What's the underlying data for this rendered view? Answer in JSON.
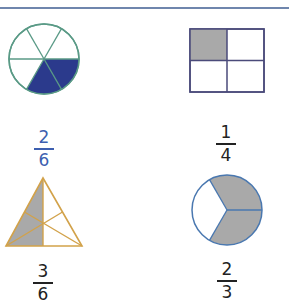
{
  "header": {
    "rule_color": "#6f86ad"
  },
  "figures": [
    {
      "shape": "circle",
      "parts": 6,
      "shaded": 2,
      "stroke_color": "#5a9a86",
      "fill_color": "#2b3a8c",
      "fraction": {
        "numerator": "2",
        "denominator": "6",
        "color": "#3d5fb0"
      }
    },
    {
      "shape": "square",
      "parts": 4,
      "shaded": 1,
      "stroke_color": "#4a4a7a",
      "fill_color": "#a9a9a9",
      "fraction": {
        "numerator": "1",
        "denominator": "4",
        "color": "#222222"
      }
    },
    {
      "shape": "triangle",
      "parts": 6,
      "shaded": 3,
      "stroke_color": "#d2a24a",
      "fill_color": "#a9a9a9",
      "fraction": {
        "numerator": "3",
        "denominator": "6",
        "color": "#222222"
      }
    },
    {
      "shape": "circle",
      "parts": 3,
      "shaded": 2,
      "stroke_color": "#4a78b0",
      "fill_color": "#a9a9a9",
      "fraction": {
        "numerator": "2",
        "denominator": "3",
        "color": "#222222"
      }
    }
  ]
}
